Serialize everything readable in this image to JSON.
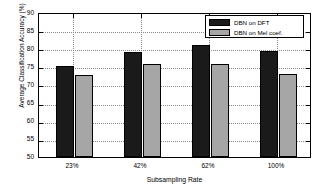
{
  "chart_data": {
    "type": "bar",
    "title": "",
    "xlabel": "Subsampling Rate",
    "ylabel": "Average Classification Accuracy (%)",
    "categories": [
      "23%",
      "42%",
      "62%",
      "100%"
    ],
    "series": [
      {
        "name": "DBN on DFT",
        "color": "#1a1a1a",
        "values": [
          75.4,
          79.5,
          81.2,
          79.6
        ]
      },
      {
        "name": "DBN on Mel coef.",
        "color": "#a6a6a6",
        "values": [
          72.8,
          76.1,
          76.1,
          73.2
        ]
      }
    ],
    "ylim": [
      50,
      90
    ],
    "yticks": [
      50,
      55,
      60,
      65,
      70,
      75,
      80,
      85,
      90
    ],
    "ytick_labels": [
      "50",
      "55",
      "60",
      "65",
      "70",
      "75",
      "80",
      "85",
      "90"
    ],
    "grid": true,
    "legend_position": "upper right"
  },
  "legend": {
    "items": [
      {
        "label": "DBN on DFT"
      },
      {
        "label": "DBN on Mel coef."
      }
    ]
  },
  "axis": {
    "y_title": "Average Classification Accuracy (%)",
    "x_title": "Subsampling Rate",
    "y_labels": [
      "90",
      "85",
      "80",
      "75",
      "70",
      "65",
      "60",
      "55",
      "50"
    ],
    "x_labels": [
      "23%",
      "42%",
      "62%",
      "100%"
    ]
  }
}
